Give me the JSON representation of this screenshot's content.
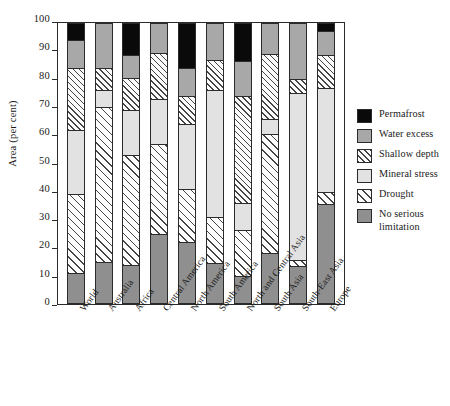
{
  "chart_data": {
    "type": "bar",
    "subtype": "stacked-bar-100",
    "title": "",
    "xlabel": "",
    "ylabel": "Area (per cent)",
    "ylim": [
      0,
      100
    ],
    "yticks": [
      0,
      10,
      20,
      30,
      40,
      50,
      60,
      70,
      80,
      90,
      100
    ],
    "grid": false,
    "legend_position": "right",
    "categories": [
      "World",
      "Australia",
      "Africa",
      "Central America",
      "North America",
      "South America",
      "North and Central Asia",
      "South Asia",
      "South-East Asia",
      "Europe"
    ],
    "series": [
      {
        "name": "No serious limitation",
        "fill": "noserious",
        "color": "#8f8f8f",
        "values": [
          11,
          15,
          14,
          25,
          22,
          14.5,
          10,
          18,
          13.5,
          35.5
        ]
      },
      {
        "name": "Drought",
        "fill": "drought",
        "color": "#ffffff",
        "values": [
          28,
          55,
          39,
          32,
          19,
          16.5,
          16.5,
          42.5,
          2,
          4.5
        ]
      },
      {
        "name": "Mineral stress",
        "fill": "mineral",
        "color": "#e2e2e2",
        "values": [
          23,
          6,
          16,
          16,
          23,
          45,
          9.5,
          5.5,
          59.5,
          37
        ]
      },
      {
        "name": "Shallow depth",
        "fill": "shallow",
        "color": "#ffffff",
        "values": [
          22,
          8,
          11.5,
          16.5,
          10,
          11,
          38,
          23,
          5,
          11.5
        ]
      },
      {
        "name": "Water excess",
        "fill": "water",
        "color": "#a8a8a8",
        "values": [
          10,
          16,
          8,
          10.5,
          10,
          13,
          12.5,
          11,
          20,
          8.5
        ]
      },
      {
        "name": "Permafrost",
        "fill": "permafrost",
        "color": "#0a0a0a",
        "values": [
          6,
          0,
          11.5,
          0,
          16,
          0,
          13.5,
          0,
          0,
          3
        ]
      }
    ]
  },
  "legend": {
    "items": [
      {
        "label": "Permafrost",
        "fill": "permafrost"
      },
      {
        "label": "Water excess",
        "fill": "water"
      },
      {
        "label": "Shallow depth",
        "fill": "shallow"
      },
      {
        "label": "Mineral stress",
        "fill": "mineral"
      },
      {
        "label": "Drought",
        "fill": "drought"
      },
      {
        "label": "No serious limitation",
        "fill": "noserious"
      }
    ]
  },
  "colors": {
    "permafrost": "#0a0a0a",
    "water_excess": "#a8a8a8",
    "shallow_depth": "#ffffff",
    "mineral_stress": "#e2e2e2",
    "drought": "#ffffff",
    "no_serious_limitation": "#8f8f8f",
    "axis": "#2b2b2b",
    "background": "#ffffff"
  }
}
